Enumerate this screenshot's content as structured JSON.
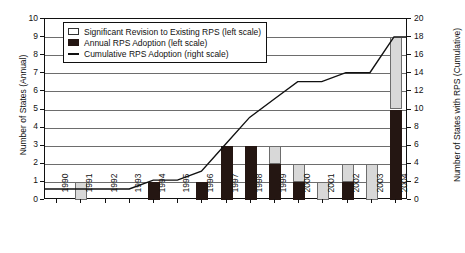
{
  "chart_data": {
    "type": "bar",
    "title": "",
    "subtitle": "",
    "xlabel": "",
    "ylabel": "Number of States (Annual)",
    "ylabel_right": "Number of States with RPS (Cumulative)",
    "categories": [
      "1990",
      "1991",
      "1992",
      "1993",
      "1994",
      "1995",
      "1996",
      "1997",
      "1998",
      "1999",
      "2000",
      "2001",
      "2002",
      "2003",
      "2004"
    ],
    "ylim": [
      0,
      10
    ],
    "ylim_right": [
      0,
      20
    ],
    "yticks": [
      "0",
      "1",
      "2",
      "3",
      "4",
      "5",
      "6",
      "7",
      "8",
      "9",
      "10"
    ],
    "yticks_right": [
      "0",
      "2",
      "4",
      "6",
      "8",
      "10",
      "12",
      "14",
      "16",
      "18",
      "20"
    ],
    "grid": true,
    "legend_position": "top-left",
    "series": [
      {
        "name": "Annual RPS Adoption (left scale)",
        "axis": "left",
        "type": "bar",
        "color": "#241612",
        "values": [
          0,
          0,
          0,
          0,
          1,
          0,
          1,
          3,
          3,
          2,
          1,
          0,
          1,
          0,
          5
        ]
      },
      {
        "name": "Significant Revision to Existing RPS (left scale)",
        "axis": "left",
        "type": "bar",
        "color": "#d8d8d8",
        "values": [
          0,
          1,
          0,
          0,
          0,
          0,
          0,
          0,
          0,
          1,
          1,
          1,
          1,
          2,
          4
        ]
      },
      {
        "name": "Cumulative RPS Adoption (right scale)",
        "axis": "right",
        "type": "line",
        "color": "#111111",
        "values": [
          1,
          1,
          1,
          1,
          2,
          2,
          3,
          6,
          9,
          11,
          13,
          13,
          14,
          14,
          18
        ]
      }
    ]
  },
  "legend": {
    "items": [
      {
        "marker": "open-square",
        "label": "Significant Revision to Existing RPS (left scale)"
      },
      {
        "marker": "filled-square",
        "label": "Annual RPS Adoption (left scale)"
      },
      {
        "marker": "line",
        "label": "Cumulative RPS Adoption (right scale)"
      }
    ]
  },
  "colors": {
    "annual_bar": "#241612",
    "revision_bar": "#d8d8d8",
    "line": "#111111",
    "grid": "#6d6d6d",
    "axis": "#111111",
    "background": "#ffffff"
  }
}
